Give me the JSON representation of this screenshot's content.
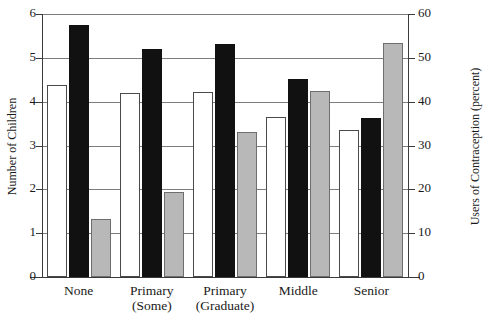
{
  "chart_data": {
    "type": "bar",
    "title": "",
    "categories": [
      "None",
      "Primary\n(Some)",
      "Primary\n(Graduate)",
      "Middle",
      "Senior"
    ],
    "category_lines": [
      [
        "None",
        ""
      ],
      [
        "Primary",
        "(Some)"
      ],
      [
        "Primary",
        "(Graduate)"
      ],
      [
        "Middle",
        ""
      ],
      [
        "Senior",
        ""
      ]
    ],
    "series": [
      {
        "name": "white-bar",
        "axis": "left",
        "fill": "#ffffff",
        "values": [
          4.38,
          4.2,
          4.22,
          3.65,
          3.35
        ]
      },
      {
        "name": "black-bar",
        "axis": "left",
        "fill": "#111111",
        "values": [
          5.75,
          5.2,
          5.32,
          4.52,
          3.62
        ]
      },
      {
        "name": "gray-bar",
        "axis": "right",
        "fill": "#b8b8b8",
        "values": [
          13.2,
          19.3,
          33.0,
          42.5,
          53.5
        ]
      }
    ],
    "xlabel": "",
    "ylabel": "Number of Children",
    "y2label": "Users of Contraception (percent)",
    "ylim": [
      0,
      6
    ],
    "y2lim": [
      0,
      60
    ],
    "yticks": [
      "0",
      "1",
      "2",
      "3",
      "4",
      "5",
      "6"
    ],
    "y2ticks": [
      "0",
      "10",
      "20",
      "30",
      "40",
      "50",
      "60"
    ],
    "grid": true,
    "legend": "none"
  },
  "top_fragment": ""
}
